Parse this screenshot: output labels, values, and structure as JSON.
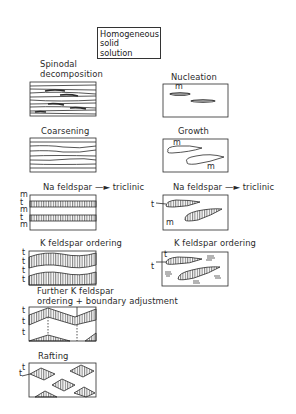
{
  "diagram": {
    "start": {
      "lines": [
        "Homogeneous",
        "solid",
        "solution"
      ]
    },
    "left_column": {
      "stages": [
        {
          "label_lines": [
            "Spinodal",
            "decomposition"
          ]
        },
        {
          "label_lines": [
            "Coarsening"
          ]
        },
        {
          "label_lines": [
            "Na feldspar → triclinic"
          ],
          "side_labels": [
            "m",
            "t",
            "m",
            "t",
            "m"
          ]
        },
        {
          "label_lines": [
            "K feldspar ordering"
          ],
          "side_labels": [
            "t",
            "t",
            "t",
            "t"
          ]
        },
        {
          "label_lines": [
            "Further K feldspar",
            "ordering + boundary adjustment"
          ],
          "side_labels": [
            "t",
            "t",
            "t"
          ]
        },
        {
          "label_lines": [
            "Rafting"
          ],
          "side_labels": [
            "t",
            "t"
          ]
        }
      ]
    },
    "right_column": {
      "stages": [
        {
          "label_lines": [
            "Nucleation"
          ],
          "inner_labels": [
            "m"
          ]
        },
        {
          "label_lines": [
            "Growth"
          ],
          "inner_labels": [
            "m",
            "m"
          ]
        },
        {
          "label_lines": [
            "Na feldspar → triclinic"
          ],
          "side_labels": [
            "t"
          ],
          "inner_labels": [
            "m"
          ]
        },
        {
          "label_lines": [
            "K feldspar ordering"
          ],
          "side_labels": [
            "t"
          ],
          "inner_labels": [
            "t"
          ]
        }
      ]
    },
    "colors": {
      "ink": "#2a2a2a",
      "background": "#ffffff"
    }
  },
  "text": {
    "hs1": "Homogeneous",
    "hs2": "solid",
    "hs3": "solution",
    "spinodal1": "Spinodal",
    "spinodal2": "decomposition",
    "nucleation": "Nucleation",
    "coarsening": "Coarsening",
    "growth": "Growth",
    "na_left_a": "Na feldspar",
    "na_left_b": "triclinic",
    "na_right_a": "Na feldspar",
    "na_right_b": "triclinic",
    "k_left": "K feldspar ordering",
    "k_right": "K feldspar ordering",
    "further1": "Further K feldspar",
    "further2": "ordering + boundary adjustment",
    "rafting": "Rafting",
    "m": "m",
    "t": "t"
  }
}
